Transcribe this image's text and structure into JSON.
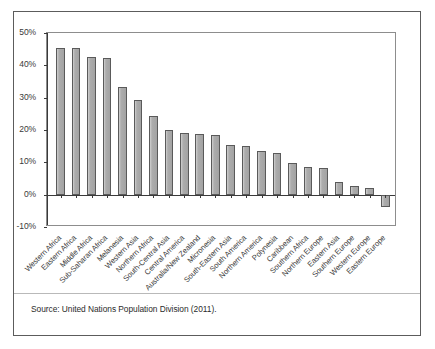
{
  "figure": {
    "source_note": "Source: United Nations Population Division (2011).",
    "frame_color": "#5c5c5c",
    "bar_fill": "#a8a8a8",
    "bar_stroke": "#5a5a5a"
  },
  "chart_data": {
    "type": "bar",
    "title": "",
    "subtitle": "",
    "xlabel": "",
    "ylabel": "",
    "ylim": [
      -10,
      50
    ],
    "ytick_values": [
      -10,
      0,
      10,
      20,
      30,
      40,
      50
    ],
    "ytick_labels": [
      "-10%",
      "0%",
      "10%",
      "20%",
      "30%",
      "40%",
      "50%"
    ],
    "grid": false,
    "legend": "none",
    "units": "percent",
    "categories": [
      "Western Africa",
      "Eastern Africa",
      "Middle Africa",
      "Sub-Saharan Africa",
      "Melanesia",
      "Western Asia",
      "Northern Africa",
      "South-Central Asia",
      "Central America",
      "Australia/New Zealand",
      "Micronesia",
      "South-Eastern Asia",
      "South America",
      "Northern America",
      "Polynesia",
      "Caribbean",
      "Southern Africa",
      "Northern Europe",
      "Eastern Asia",
      "Southern Europe",
      "Western Europe",
      "Eastern Europe"
    ],
    "values": [
      45.3,
      45.3,
      42.7,
      42.4,
      33.4,
      29.2,
      24.3,
      20.0,
      19.1,
      18.8,
      18.4,
      15.5,
      14.9,
      13.5,
      13.0,
      9.8,
      8.7,
      8.3,
      4.0,
      2.6,
      2.2,
      -3.7
    ]
  }
}
